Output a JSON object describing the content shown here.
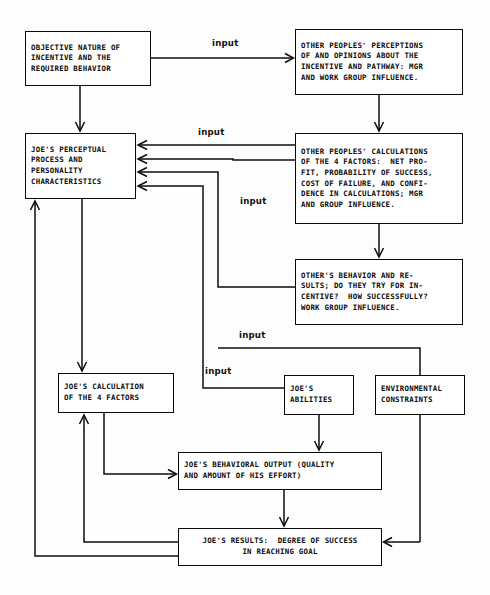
{
  "diagram": {
    "background_color": "#fdfdfd",
    "line_color": "#0d0d0d",
    "box_fill": "#ffffff"
  },
  "boxes": {
    "objective_nature": {
      "id": "objective-nature-of-incentive",
      "lines": [
        "OBJECTIVE NATURE OF",
        "INCENTIVE AND THE",
        "REQUIRED BEHAVIOR"
      ],
      "x": 25,
      "y": 31,
      "w": 126,
      "h": 55
    },
    "other_perceptions": {
      "id": "other-peoples-perceptions",
      "lines": [
        "OTHER PEOPLES' PERCEPTIONS",
        "OF AND OPINIONS ABOUT THE",
        "INCENTIVE AND PATHWAY: MGR",
        "AND WORK GROUP INFLUENCE."
      ],
      "x": 295,
      "y": 29,
      "w": 168,
      "h": 66
    },
    "joes_perceptual": {
      "id": "joes-perceptual-process",
      "lines": [
        "JOE'S PERCEPTUAL",
        "PROCESS AND",
        "PERSONALITY",
        "CHARACTERISTICS"
      ],
      "x": 25,
      "y": 133,
      "w": 111,
      "h": 66
    },
    "other_calculations": {
      "id": "other-peoples-calculations",
      "lines": [
        "OTHER PEOPLES' CALCULATIONS",
        "OF THE 4 FACTORS:  NET PRO-",
        "FIT, PROBABILITY OF SUCCESS,",
        "COST OF FAILURE, AND CONFI-",
        "DENCE IN CALCULATIONS; MGR",
        "AND GROUP INFLUENCE."
      ],
      "x": 295,
      "y": 133,
      "w": 168,
      "h": 91
    },
    "others_behavior": {
      "id": "others-behavior-and-results",
      "lines": [
        "OTHER'S BEHAVIOR AND RE-",
        "SULTS; DO THEY TRY FOR IN-",
        "CENTIVE?  HOW SUCCESSFULLY?",
        "WORK GROUP INFLUENCE."
      ],
      "x": 295,
      "y": 259,
      "w": 168,
      "h": 66
    },
    "joes_calculation": {
      "id": "joes-calculation-of-4-factors",
      "lines": [
        "JOE'S CALCULATION",
        "OF THE 4 FACTORS"
      ],
      "x": 58,
      "y": 373,
      "w": 116,
      "h": 40
    },
    "joes_abilities": {
      "id": "joes-abilities",
      "lines": [
        "JOE'S",
        "ABILITIES"
      ],
      "x": 284,
      "y": 375,
      "w": 70,
      "h": 40
    },
    "environmental_constraints": {
      "id": "environmental-constraints",
      "lines": [
        "ENVIRONMENTAL",
        "CONSTRAINTS"
      ],
      "x": 375,
      "y": 375,
      "w": 90,
      "h": 40
    },
    "behavioral_output": {
      "id": "joes-behavioral-output",
      "lines": [
        "JOE'S BEHAVIORAL OUTPUT (QUALITY",
        "AND AMOUNT OF HIS EFFORT)"
      ],
      "x": 178,
      "y": 452,
      "w": 204,
      "h": 38
    },
    "joes_results": {
      "id": "joes-results-degree-of-success",
      "lines": [
        "JOE'S RESULTS:  DEGREE OF SUCCESS",
        "IN REACHING GOAL"
      ],
      "x": 178,
      "y": 528,
      "w": 204,
      "h": 38
    }
  },
  "edge_labels": [
    {
      "id": "input-label-1",
      "text": "input",
      "x": 212,
      "y": 38
    },
    {
      "id": "input-label-2",
      "text": "input",
      "x": 198,
      "y": 127
    },
    {
      "id": "input-label-3",
      "text": "input",
      "x": 240,
      "y": 196
    },
    {
      "id": "input-label-4",
      "text": "input",
      "x": 239,
      "y": 330
    },
    {
      "id": "input-label-5",
      "text": "input",
      "x": 205,
      "y": 366
    }
  ],
  "connections": [
    {
      "id": "objective-to-perceptions",
      "label": "input",
      "from": "objective_nature",
      "to": "other_perceptions"
    },
    {
      "id": "objective-to-perceptual",
      "label": "",
      "from": "objective_nature",
      "to": "joes_perceptual"
    },
    {
      "id": "perceptions-to-calculations",
      "label": "",
      "from": "other_perceptions",
      "to": "other_calculations"
    },
    {
      "id": "calculations-to-perceptual",
      "label": "input",
      "from": "other_calculations",
      "to": "joes_perceptual"
    },
    {
      "id": "calculations-to-behavior",
      "label": "",
      "from": "other_calculations",
      "to": "others_behavior"
    },
    {
      "id": "calculations-side-to-perceptual",
      "label": "input",
      "from": "other_calculations",
      "to": "joes_perceptual"
    },
    {
      "id": "others-behavior-to-perceptual",
      "label": "input",
      "from": "others_behavior",
      "to": "joes_perceptual"
    },
    {
      "id": "abilities-to-perceptual",
      "label": "input",
      "from": "joes_abilities",
      "to": "joes_perceptual"
    },
    {
      "id": "perceptual-to-calculation",
      "label": "",
      "from": "joes_perceptual",
      "to": "joes_calculation"
    },
    {
      "id": "calculation-to-output",
      "label": "",
      "from": "joes_calculation",
      "to": "behavioral_output"
    },
    {
      "id": "abilities-to-output",
      "label": "",
      "from": "joes_abilities",
      "to": "behavioral_output"
    },
    {
      "id": "output-to-results",
      "label": "",
      "from": "behavioral_output",
      "to": "joes_results"
    },
    {
      "id": "constraints-to-results",
      "label": "",
      "from": "environmental_constraints",
      "to": "joes_results"
    },
    {
      "id": "results-to-calculation",
      "label": "",
      "from": "joes_results",
      "to": "joes_calculation"
    },
    {
      "id": "results-to-perceptual",
      "label": "",
      "from": "joes_results",
      "to": "joes_perceptual"
    }
  ]
}
